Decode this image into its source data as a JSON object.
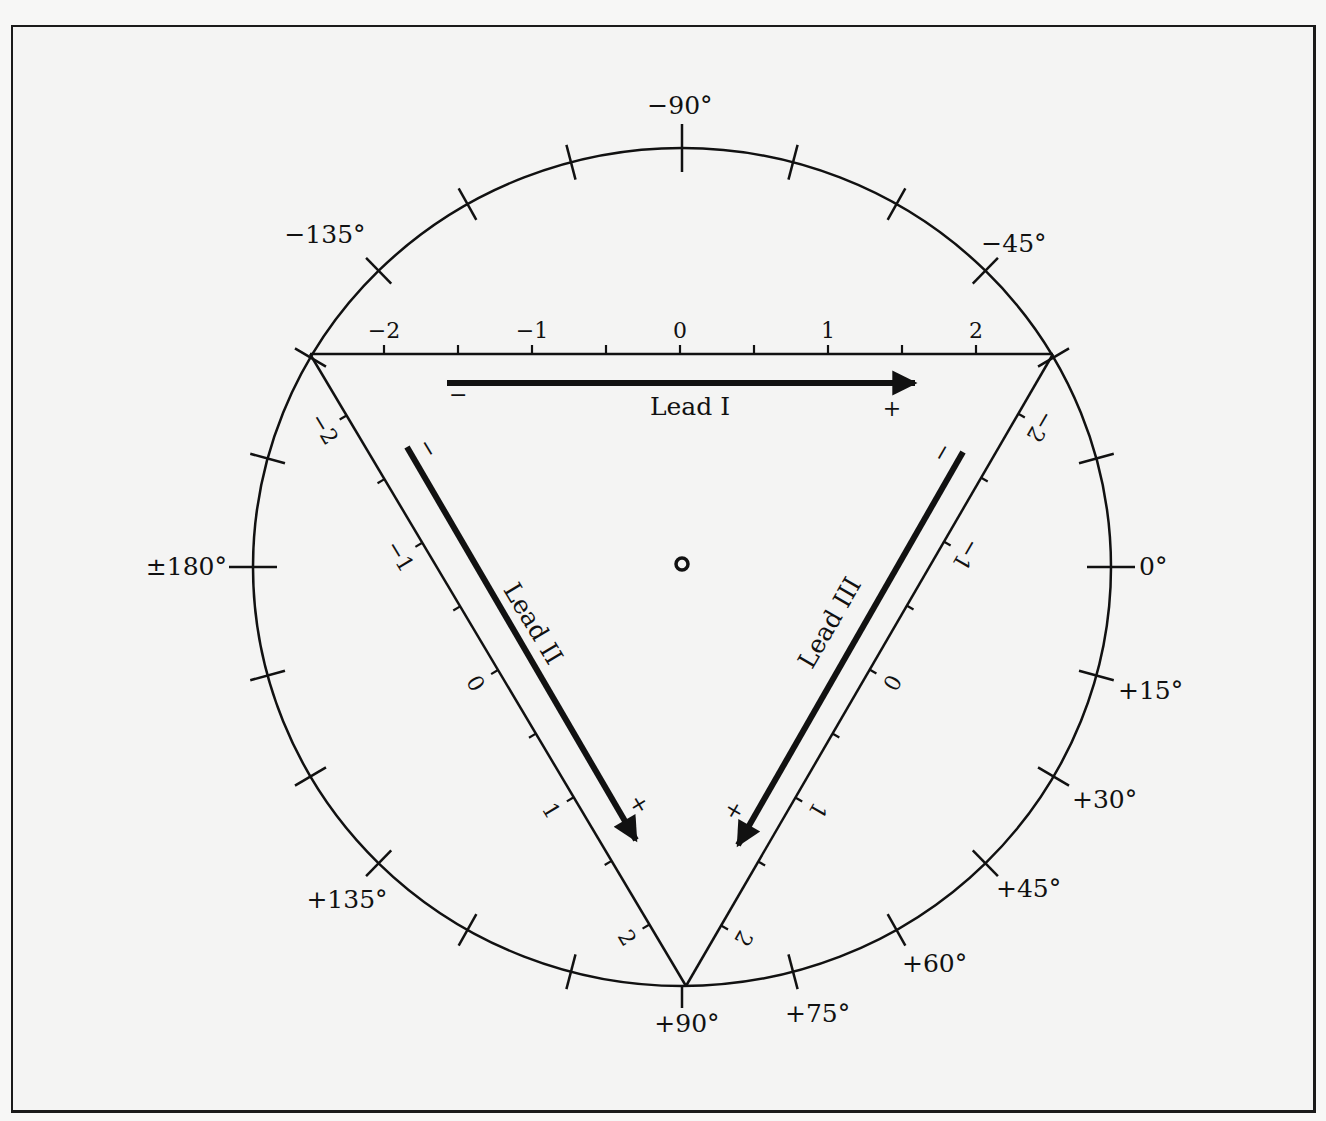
{
  "diagram": {
    "title": "",
    "center_marker": "origin-circle",
    "circle": {
      "tick_interval_deg": 15,
      "labels": [
        {
          "angle": -90,
          "text": "−90°"
        },
        {
          "angle": -135,
          "text": "−135°"
        },
        {
          "angle": -45,
          "text": "−45°"
        },
        {
          "angle": 180,
          "text": "±180°"
        },
        {
          "angle": 0,
          "text": "0°"
        },
        {
          "angle": 15,
          "text": "+15°"
        },
        {
          "angle": 30,
          "text": "+30°"
        },
        {
          "angle": 45,
          "text": "+45°"
        },
        {
          "angle": 60,
          "text": "+60°"
        },
        {
          "angle": 75,
          "text": "+75°"
        },
        {
          "angle": 90,
          "text": "+90°"
        },
        {
          "angle": 135,
          "text": "+135°"
        }
      ]
    },
    "leads": {
      "lead1": {
        "label": "Lead I",
        "minus": "−",
        "plus": "+",
        "scale": [
          "−2",
          "−1",
          "0",
          "1",
          "2"
        ]
      },
      "lead2": {
        "label": "Lead II",
        "minus": "−",
        "plus": "+",
        "scale": [
          "−2",
          "−1",
          "0",
          "1",
          "2"
        ]
      },
      "lead3": {
        "label": "Lead III",
        "minus": "−",
        "plus": "+",
        "scale": [
          "−2",
          "−1",
          "0",
          "1",
          "2"
        ]
      }
    }
  },
  "colors": {
    "ink": "#111111",
    "background": "#f4f4f3"
  }
}
